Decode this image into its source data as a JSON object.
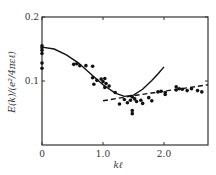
{
  "chart_data": {
    "type": "scatter",
    "title": "",
    "xlabel": "kℓ",
    "ylabel": "E(k)/(e²/4πεℓ)",
    "xlim": [
      0,
      2.72
    ],
    "ylim": [
      0,
      0.2
    ],
    "x_ticks": [
      {
        "value": 0,
        "label": "0"
      },
      {
        "value": 1.0,
        "label": "1.0"
      },
      {
        "value": 2.0,
        "label": "2.0"
      }
    ],
    "y_ticks": [
      {
        "value": 0.1,
        "label": "0.1"
      },
      {
        "value": 0.2,
        "label": "0.2"
      }
    ],
    "grid": false,
    "legend": null,
    "series": [
      {
        "name": "data points",
        "style": "markers",
        "points": [
          [
            0.0,
            0.155
          ],
          [
            0.0,
            0.152
          ],
          [
            0.0,
            0.148
          ],
          [
            0.0,
            0.143
          ],
          [
            0.0,
            0.128
          ],
          [
            0.0,
            0.12
          ],
          [
            0.52,
            0.126
          ],
          [
            0.57,
            0.127
          ],
          [
            0.62,
            0.124
          ],
          [
            0.72,
            0.124
          ],
          [
            0.83,
            0.123
          ],
          [
            0.83,
            0.105
          ],
          [
            0.85,
            0.095
          ],
          [
            0.9,
            0.101
          ],
          [
            0.97,
            0.103
          ],
          [
            1.0,
            0.099
          ],
          [
            1.03,
            0.104
          ],
          [
            1.05,
            0.096
          ],
          [
            1.03,
            0.09
          ],
          [
            1.1,
            0.092
          ],
          [
            1.2,
            0.082
          ],
          [
            1.27,
            0.064
          ],
          [
            1.35,
            0.071
          ],
          [
            1.4,
            0.066
          ],
          [
            1.45,
            0.07
          ],
          [
            1.48,
            0.075
          ],
          [
            1.52,
            0.072
          ],
          [
            1.55,
            0.068
          ],
          [
            1.62,
            0.07
          ],
          [
            1.65,
            0.065
          ],
          [
            1.48,
            0.054
          ],
          [
            1.48,
            0.049
          ],
          [
            1.75,
            0.074
          ],
          [
            1.8,
            0.069
          ],
          [
            1.9,
            0.083
          ],
          [
            1.95,
            0.084
          ],
          [
            2.02,
            0.079
          ],
          [
            2.02,
            0.082
          ],
          [
            2.2,
            0.091
          ],
          [
            2.2,
            0.086
          ],
          [
            2.25,
            0.088
          ],
          [
            2.3,
            0.087
          ],
          [
            2.38,
            0.085
          ],
          [
            2.45,
            0.088
          ],
          [
            2.55,
            0.085
          ],
          [
            2.62,
            0.083
          ]
        ]
      },
      {
        "name": "solid curve",
        "style": "solid",
        "points": [
          [
            0.0,
            0.153
          ],
          [
            0.2,
            0.15
          ],
          [
            0.4,
            0.141
          ],
          [
            0.6,
            0.128
          ],
          [
            0.8,
            0.111
          ],
          [
            1.0,
            0.094
          ],
          [
            1.2,
            0.081
          ],
          [
            1.35,
            0.076
          ],
          [
            1.5,
            0.078
          ],
          [
            1.65,
            0.087
          ],
          [
            1.8,
            0.101
          ],
          [
            1.9,
            0.111
          ],
          [
            2.0,
            0.122
          ]
        ]
      },
      {
        "name": "dashed line",
        "style": "dashed",
        "points": [
          [
            1.0,
            0.069
          ],
          [
            1.5,
            0.077
          ],
          [
            2.0,
            0.084
          ],
          [
            2.72,
            0.094
          ]
        ]
      }
    ]
  }
}
